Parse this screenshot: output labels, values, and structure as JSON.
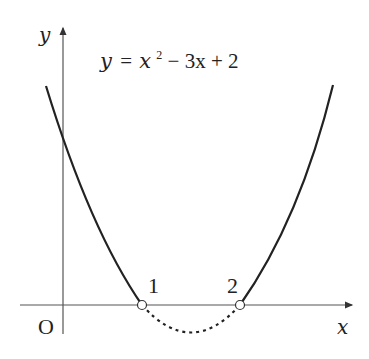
{
  "figure": {
    "equation": "y = x² − 3x + 2",
    "equation_parts": {
      "lhs": "y",
      "eq": "=",
      "x": "x",
      "sup": "2",
      "rest": " − 3x + 2"
    },
    "axis_labels": {
      "x": "x",
      "y": "y",
      "origin": "O"
    },
    "roots": [
      {
        "x": 1,
        "label": "1",
        "marker": "open-circle"
      },
      {
        "x": 2,
        "label": "2",
        "marker": "open-circle"
      }
    ],
    "segment_below_axis": "dotted",
    "segment_above_axis": "solid",
    "colors": {
      "curve": "#222222",
      "axis": "#555555",
      "background": "#ffffff"
    }
  }
}
